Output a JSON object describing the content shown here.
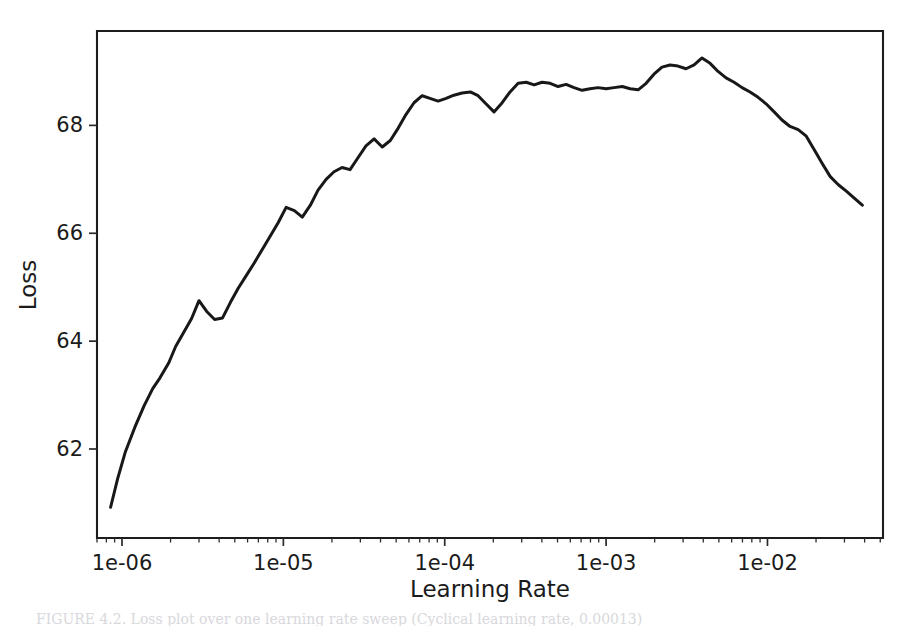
{
  "figure": {
    "background_color": "#ffffff",
    "line_color": "#181818",
    "axis_color": "#1d1d1d"
  },
  "caption": {
    "text": "FIGURE 4.2. Loss plot over one learning rate sweep (Cyclical learning rate, 0.00013)"
  },
  "chart_data": {
    "type": "line",
    "title": "",
    "xlabel": "Learning Rate",
    "ylabel": "Loss",
    "xscale": "log",
    "yscale": "linear",
    "grid": false,
    "legend": null,
    "xlim": [
      7e-07,
      0.052
    ],
    "ylim": [
      60.35,
      69.75
    ],
    "xtick_labels": [
      "1e-06",
      "1e-05",
      "1e-04",
      "1e-03",
      "1e-02"
    ],
    "xtick_values": [
      1e-06,
      1e-05,
      0.0001,
      0.001,
      0.01
    ],
    "ytick_labels": [
      "62",
      "64",
      "66",
      "68"
    ],
    "ytick_values": [
      62,
      64,
      66,
      68
    ],
    "series": [
      {
        "name": "Loss",
        "color": "#181818",
        "x": [
          8.5e-07,
          9.4e-07,
          1.05e-06,
          1.2e-06,
          1.37e-06,
          1.55e-06,
          1.72e-06,
          1.95e-06,
          2.15e-06,
          2.4e-06,
          2.7e-06,
          3e-06,
          3.35e-06,
          3.75e-06,
          4.2e-06,
          4.7e-06,
          5.25e-06,
          5.9e-06,
          6.6e-06,
          7.4e-06,
          8.3e-06,
          9.3e-06,
          1.04e-05,
          1.17e-05,
          1.31e-05,
          1.47e-05,
          1.64e-05,
          1.84e-05,
          2.06e-05,
          2.31e-05,
          2.59e-05,
          2.9e-05,
          3.25e-05,
          3.65e-05,
          4.1e-05,
          4.6e-05,
          5.15e-05,
          5.75e-05,
          6.45e-05,
          7.25e-05,
          8.1e-05,
          9.1e-05,
          0.000102,
          0.000114,
          0.000128,
          0.000144,
          0.000161,
          0.00018,
          0.000202,
          0.000227,
          0.000254,
          0.000285,
          0.00032,
          0.000358,
          0.000401,
          0.00045,
          0.000504,
          0.000565,
          0.000633,
          0.00071,
          0.000795,
          0.000892,
          0.001,
          0.00112,
          0.00126,
          0.00141,
          0.00158,
          0.00177,
          0.00198,
          0.00222,
          0.00249,
          0.00279,
          0.00313,
          0.00351,
          0.00393,
          0.00441,
          0.00494,
          0.00554,
          0.00621,
          0.00696,
          0.0078,
          0.00875,
          0.0098,
          0.011,
          0.0123,
          0.0138,
          0.0155,
          0.0174,
          0.0195,
          0.0218,
          0.0245,
          0.0275,
          0.0308,
          0.0345,
          0.0387
        ],
        "y": [
          60.92,
          61.45,
          61.95,
          62.4,
          62.8,
          63.12,
          63.32,
          63.6,
          63.9,
          64.15,
          64.42,
          64.75,
          64.55,
          64.4,
          64.43,
          64.72,
          64.98,
          65.22,
          65.45,
          65.7,
          65.95,
          66.2,
          66.48,
          66.42,
          66.3,
          66.52,
          66.8,
          67.0,
          67.14,
          67.22,
          67.18,
          67.4,
          67.62,
          67.75,
          67.6,
          67.72,
          67.95,
          68.2,
          68.42,
          68.55,
          68.5,
          68.45,
          68.5,
          68.56,
          68.6,
          68.62,
          68.55,
          68.4,
          68.25,
          68.42,
          68.62,
          68.78,
          68.8,
          68.75,
          68.8,
          68.78,
          68.72,
          68.76,
          68.7,
          68.65,
          68.68,
          68.7,
          68.68,
          68.7,
          68.72,
          68.68,
          68.66,
          68.78,
          68.95,
          69.08,
          69.12,
          69.1,
          69.05,
          69.12,
          69.25,
          69.15,
          69.0,
          68.88,
          68.8,
          68.7,
          68.62,
          68.52,
          68.4,
          68.25,
          68.1,
          67.98,
          67.92,
          67.8,
          67.55,
          67.3,
          67.05,
          66.9,
          66.78,
          66.65,
          66.52
        ]
      }
    ]
  }
}
